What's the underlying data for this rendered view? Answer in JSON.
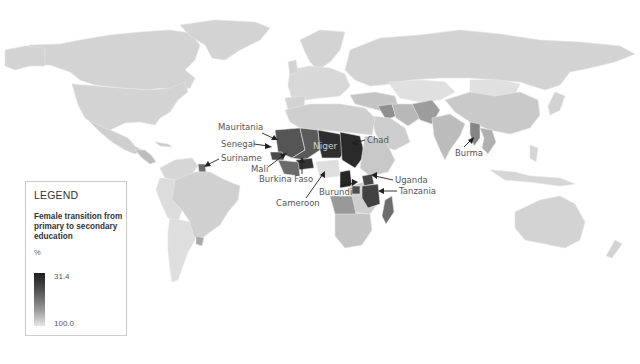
{
  "map": {
    "title": "Female transition from primary to secondary education",
    "projection": "world",
    "colors": {
      "background": "#ffffff",
      "ocean": "#ffffff",
      "default_land": "#d3d3d3",
      "light_land": "#e0e0e0",
      "mid_land": "#b5b5b5",
      "mid_dark": "#8a8a8a",
      "dark": "#555555",
      "darkest": "#2a2a2a"
    },
    "labeled_countries": [
      {
        "name": "Mauritania",
        "shade": "dark"
      },
      {
        "name": "Senegal",
        "shade": "dark"
      },
      {
        "name": "Suriname",
        "shade": "dark"
      },
      {
        "name": "Mali",
        "shade": "dark"
      },
      {
        "name": "Burkina Faso",
        "shade": "darkest"
      },
      {
        "name": "Niger",
        "shade": "darkest"
      },
      {
        "name": "Chad",
        "shade": "darkest"
      },
      {
        "name": "Cameroon",
        "shade": "darkest"
      },
      {
        "name": "Uganda",
        "shade": "dark"
      },
      {
        "name": "Burundi",
        "shade": "dark"
      },
      {
        "name": "Tanzania",
        "shade": "dark"
      },
      {
        "name": "Burma",
        "shade": "mid_dark"
      }
    ]
  },
  "legend": {
    "heading": "LEGEND",
    "subtitle": "Female transition from primary to secondary education",
    "unit": "%",
    "max_label": "31.4",
    "min_label": "100.0",
    "scale_range": [
      31.4,
      100.0
    ]
  }
}
